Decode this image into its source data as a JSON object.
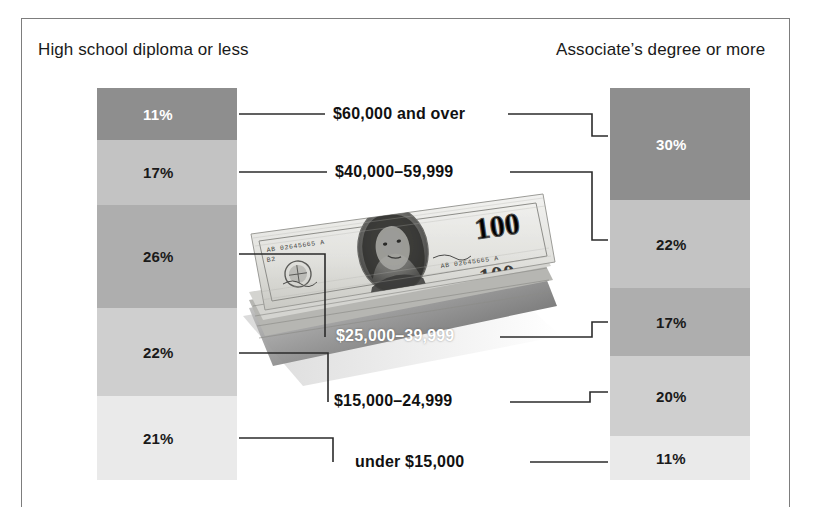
{
  "chart_data": {
    "type": "bar",
    "title": "",
    "subtitle": "",
    "xlabel": "",
    "ylabel": "",
    "grid": false,
    "legend_position": "top",
    "units": "percent",
    "categories": [
      "$60,000 and over",
      "$40,000–59,999",
      "$25,000–39,999",
      "$15,000–24,999",
      "under $15,000"
    ],
    "series": [
      {
        "name": "High school diploma or less",
        "values": [
          11,
          17,
          26,
          22,
          21
        ]
      },
      {
        "name": "Associate’s degree or more",
        "values": [
          30,
          22,
          17,
          20,
          11
        ]
      }
    ]
  },
  "headings": {
    "left": "High school diploma or less",
    "right": "Associate’s degree or more"
  },
  "categories": [
    {
      "label": "$60,000 and over",
      "style": "dark"
    },
    {
      "label": "$40,000–59,999",
      "style": "dark"
    },
    {
      "label": "$25,000–39,999",
      "style": "white"
    },
    {
      "label": "$15,000–24,999",
      "style": "dark"
    },
    {
      "label": "under $15,000",
      "style": "dark"
    }
  ],
  "left_column": {
    "segments": [
      {
        "percent": "11%",
        "value": 11,
        "tone": 0,
        "ink": "light",
        "height": 52
      },
      {
        "percent": "17%",
        "value": 17,
        "tone": 1,
        "ink": "dark",
        "height": 65
      },
      {
        "percent": "26%",
        "value": 26,
        "tone": 2,
        "ink": "dark",
        "height": 103
      },
      {
        "percent": "22%",
        "value": 22,
        "tone": 3,
        "ink": "dark",
        "height": 88
      },
      {
        "percent": "21%",
        "value": 21,
        "tone": 4,
        "ink": "dark",
        "height": 84
      }
    ]
  },
  "right_column": {
    "segments": [
      {
        "percent": "30%",
        "value": 30,
        "tone": 0,
        "ink": "light",
        "height": 112
      },
      {
        "percent": "22%",
        "value": 22,
        "tone": 1,
        "ink": "dark",
        "height": 88
      },
      {
        "percent": "17%",
        "value": 17,
        "tone": 2,
        "ink": "dark",
        "height": 68
      },
      {
        "percent": "20%",
        "value": 20,
        "tone": 3,
        "ink": "dark",
        "height": 80
      },
      {
        "percent": "11%",
        "value": 11,
        "tone": 4,
        "ink": "dark",
        "height": 44
      }
    ]
  },
  "photo": {
    "alt": "stack of US one hundred dollar bills",
    "denomination": "100",
    "portrait": "Benjamin Franklin",
    "serial": "AB 02645665 A",
    "plate": "B2",
    "bank_text": "THE UNITED STATES OF AMERICA",
    "note_text": "ONE HUNDRED DOLLARS"
  },
  "colors": {
    "tone_0": "#8e8e8e",
    "tone_1": "#c3c3c3",
    "tone_2": "#aeaeae",
    "tone_3": "#cfcfcf",
    "tone_4": "#eaeaea",
    "ink": "#1a1a1a",
    "leader": "#2b2b2b",
    "frame": "#7d7d7d"
  }
}
